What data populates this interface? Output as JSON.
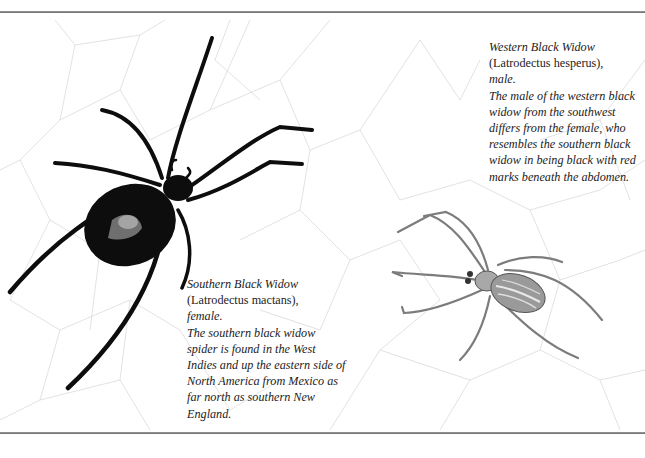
{
  "page": {
    "background": "#ffffff",
    "rule_color": "#7a7a7a"
  },
  "illustrations": [
    {
      "name": "southern-black-widow-female",
      "description": "Black spider with glossy abdomen on web",
      "color": "#0d0d0d"
    },
    {
      "name": "western-black-widow-male",
      "description": "Pale grey striped spider on web",
      "color": "#8a8a8a"
    }
  ],
  "captions": {
    "western": {
      "common_name": "Western Black Widow",
      "latin_name": "(Latrodectus hesperus),",
      "sex": "male.",
      "body_lines": [
        "The male of the western black",
        "widow from the southwest",
        "differs from the female, who",
        "resembles the southern black",
        "widow in being black with red",
        "marks beneath the abdomen."
      ]
    },
    "southern": {
      "common_name": "Southern Black Widow",
      "latin_name": "(Latrodectus mactans),",
      "sex": "female.",
      "body_lines": [
        "The southern black widow",
        "spider is found in the West",
        "Indies and up the eastern side of",
        "North America from Mexico as",
        "far north as southern New",
        "England."
      ]
    }
  }
}
